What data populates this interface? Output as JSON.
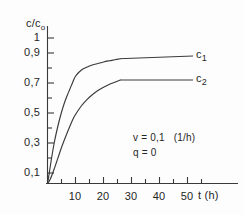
{
  "figure": {
    "background_color": "#fdfdfd",
    "ink_color": "#2b2b2b"
  },
  "axes": {
    "y_axis_label": "c/c",
    "y_axis_label_sub": "o",
    "x_axis_label": "t (h)",
    "y_tick_labels": [
      "1",
      "0,9",
      "0,7",
      "0,5",
      "0,3",
      "0,1"
    ],
    "x_tick_labels": [
      "10",
      "20",
      "30",
      "40",
      "50"
    ]
  },
  "annotations": {
    "line1": "v = 0,1   (1/h)",
    "line2": "q = 0"
  },
  "series_labels": {
    "c1_base": "c",
    "c1_sub": "1",
    "c2_base": "c",
    "c2_sub": "2"
  },
  "chart_data": {
    "type": "line",
    "title": "",
    "subtitle": "",
    "xlabel": "t (h)",
    "ylabel": "c/c_o",
    "xlim": [
      0,
      57
    ],
    "ylim": [
      0,
      1.0
    ],
    "grid": false,
    "legend_position": "inline-right-of-curve-ends",
    "x_ticks_major": [
      10,
      20,
      30,
      40,
      50
    ],
    "x_ticks_minor": [
      5,
      15,
      25,
      35,
      45,
      55
    ],
    "y_ticks_major": [
      0.1,
      0.3,
      0.5,
      0.7,
      0.9,
      1.0
    ],
    "y_ticks_minor": [
      0.2,
      0.4,
      0.6,
      0.8
    ],
    "y_tick_label_texts": [
      "0,1",
      "0,3",
      "0,5",
      "0,7",
      "0,9",
      "1"
    ],
    "x_tick_label_texts": [
      "10",
      "20",
      "30",
      "40",
      "50"
    ],
    "annotations": [
      "v = 0,1   (1/h)",
      "q = 0"
    ],
    "parameters": {
      "v": 0.1,
      "v_units": "1/h",
      "q": 0
    },
    "decimal_separator": ",",
    "series": [
      {
        "name": "c1",
        "label": "c₁",
        "x": [
          0,
          1,
          2,
          3,
          4,
          5,
          6,
          8,
          10,
          12,
          14,
          16,
          18,
          20,
          24,
          28,
          32,
          36,
          40,
          44,
          48,
          52
        ],
        "y": [
          0.0,
          0.055,
          0.115,
          0.175,
          0.23,
          0.28,
          0.325,
          0.405,
          0.475,
          0.535,
          0.585,
          0.63,
          0.675,
          0.715,
          0.755,
          0.775,
          0.79,
          0.8,
          0.81,
          0.818,
          0.825,
          0.832
        ]
      },
      {
        "name": "c2",
        "label": "c₂",
        "x": [
          0,
          1,
          2,
          3,
          4,
          5,
          6,
          8,
          10,
          12,
          14,
          16,
          18,
          20,
          24,
          28,
          32,
          36,
          40,
          44,
          48,
          52
        ],
        "y": [
          0.0,
          0.012,
          0.03,
          0.052,
          0.077,
          0.103,
          0.13,
          0.185,
          0.24,
          0.29,
          0.337,
          0.382,
          0.425,
          0.46,
          0.515,
          0.558,
          0.592,
          0.62,
          0.642,
          0.66,
          0.675,
          0.69
        ]
      }
    ]
  }
}
